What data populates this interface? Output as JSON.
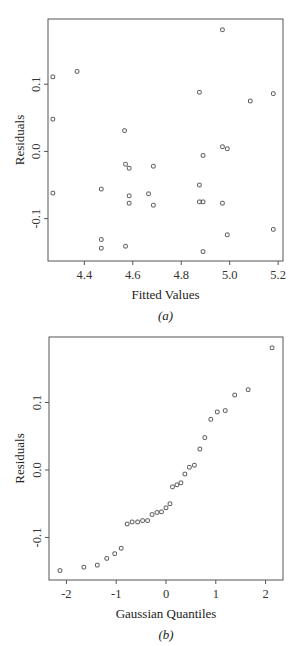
{
  "chart_data": [
    {
      "id": "a",
      "type": "scatter",
      "title": "",
      "caption": "(a)",
      "xlabel": "Fitted Values",
      "ylabel": "Residuals",
      "xlim": [
        4.25,
        5.22
      ],
      "ylim": [
        -0.163,
        0.197
      ],
      "xticks": [
        4.4,
        4.6,
        4.8,
        5.0,
        5.2
      ],
      "xtick_labels": [
        "4.4",
        "4.6",
        "4.8",
        "5.0",
        "5.2"
      ],
      "yticks": [
        -0.1,
        0.0,
        0.1
      ],
      "ytick_labels": [
        "-0.1",
        "0.0",
        "0.1"
      ],
      "grid": false,
      "legend": null,
      "marker": "open-square",
      "points": [
        {
          "x": 4.27,
          "y": 0.111
        },
        {
          "x": 4.37,
          "y": 0.119
        },
        {
          "x": 4.27,
          "y": 0.048
        },
        {
          "x": 4.566,
          "y": 0.031
        },
        {
          "x": 4.27,
          "y": -0.062
        },
        {
          "x": 4.47,
          "y": -0.056
        },
        {
          "x": 4.57,
          "y": -0.019
        },
        {
          "x": 4.585,
          "y": -0.025
        },
        {
          "x": 4.685,
          "y": -0.022
        },
        {
          "x": 4.585,
          "y": -0.066
        },
        {
          "x": 4.585,
          "y": -0.077
        },
        {
          "x": 4.665,
          "y": -0.063
        },
        {
          "x": 4.685,
          "y": -0.08
        },
        {
          "x": 4.47,
          "y": -0.131
        },
        {
          "x": 4.47,
          "y": -0.144
        },
        {
          "x": 4.57,
          "y": -0.141
        },
        {
          "x": 4.97,
          "y": 0.181
        },
        {
          "x": 4.875,
          "y": 0.088
        },
        {
          "x": 5.085,
          "y": 0.075
        },
        {
          "x": 5.18,
          "y": 0.086
        },
        {
          "x": 4.97,
          "y": 0.007
        },
        {
          "x": 4.99,
          "y": 0.004
        },
        {
          "x": 4.89,
          "y": -0.006
        },
        {
          "x": 4.875,
          "y": -0.05
        },
        {
          "x": 4.875,
          "y": -0.075
        },
        {
          "x": 4.89,
          "y": -0.075
        },
        {
          "x": 4.97,
          "y": -0.077
        },
        {
          "x": 5.18,
          "y": -0.116
        },
        {
          "x": 4.99,
          "y": -0.124
        },
        {
          "x": 4.89,
          "y": -0.149
        }
      ]
    },
    {
      "id": "b",
      "type": "scatter",
      "title": "",
      "caption": "(b)",
      "xlabel": "Gaussian Quantiles",
      "ylabel": "Residuals",
      "xlim": [
        -2.35,
        2.35
      ],
      "ylim": [
        -0.163,
        0.197
      ],
      "xticks": [
        -2,
        -1,
        0,
        1,
        2
      ],
      "xtick_labels": [
        "-2",
        "-1",
        "0",
        "1",
        "2"
      ],
      "yticks": [
        -0.1,
        0.0,
        0.1
      ],
      "ytick_labels": [
        "-0.1",
        "0.0",
        "0.1"
      ],
      "grid": false,
      "legend": null,
      "marker": "open-square",
      "points": [
        {
          "x": -2.13,
          "y": -0.149
        },
        {
          "x": -1.65,
          "y": -0.144
        },
        {
          "x": -1.38,
          "y": -0.141
        },
        {
          "x": -1.19,
          "y": -0.131
        },
        {
          "x": -1.03,
          "y": -0.124
        },
        {
          "x": -0.9,
          "y": -0.116
        },
        {
          "x": -0.78,
          "y": -0.08
        },
        {
          "x": -0.68,
          "y": -0.077
        },
        {
          "x": -0.57,
          "y": -0.077
        },
        {
          "x": -0.47,
          "y": -0.075
        },
        {
          "x": -0.37,
          "y": -0.075
        },
        {
          "x": -0.28,
          "y": -0.066
        },
        {
          "x": -0.18,
          "y": -0.063
        },
        {
          "x": -0.09,
          "y": -0.062
        },
        {
          "x": 0.0,
          "y": -0.056
        },
        {
          "x": 0.08,
          "y": -0.05
        },
        {
          "x": 0.13,
          "y": -0.025
        },
        {
          "x": 0.22,
          "y": -0.022
        },
        {
          "x": 0.3,
          "y": -0.019
        },
        {
          "x": 0.38,
          "y": -0.006
        },
        {
          "x": 0.47,
          "y": 0.004
        },
        {
          "x": 0.57,
          "y": 0.007
        },
        {
          "x": 0.68,
          "y": 0.031
        },
        {
          "x": 0.78,
          "y": 0.048
        },
        {
          "x": 0.9,
          "y": 0.075
        },
        {
          "x": 1.03,
          "y": 0.086
        },
        {
          "x": 1.19,
          "y": 0.088
        },
        {
          "x": 1.38,
          "y": 0.111
        },
        {
          "x": 1.65,
          "y": 0.119
        },
        {
          "x": 2.13,
          "y": 0.181
        }
      ]
    }
  ],
  "figure": {
    "panel_a": {
      "xlabel": "Fitted Values",
      "ylabel": "Residuals",
      "caption_letter": "a"
    },
    "panel_b": {
      "xlabel": "Gaussian Quantiles",
      "ylabel": "Residuals",
      "caption_letter": "b"
    }
  }
}
